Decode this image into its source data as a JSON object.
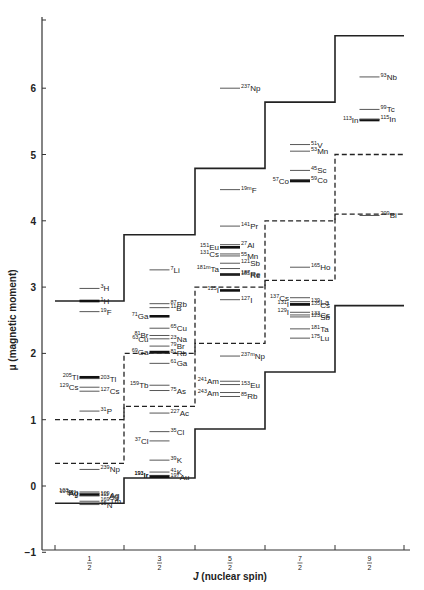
{
  "chart_data": {
    "type": "scatter",
    "title": "",
    "xlabel": "J (nuclear spin)",
    "ylabel": "μ (magnetic moment)",
    "ylim": [
      -1,
      7
    ],
    "yticks": [
      -1,
      0,
      1,
      2,
      3,
      4,
      5,
      6
    ],
    "categories": [
      "1/2",
      "3/2",
      "5/2",
      "7/2",
      "9/2"
    ],
    "grid": false,
    "legend": null,
    "schmidt_lines": [
      {
        "name": "upper (solid)",
        "style": "solid",
        "values": [
          2.79,
          3.79,
          4.79,
          5.79,
          6.79
        ]
      },
      {
        "name": "lower (solid)",
        "style": "solid",
        "values": [
          -0.26,
          0.12,
          0.86,
          1.72,
          2.72
        ]
      },
      {
        "name": "upper (dashed)",
        "style": "dashed",
        "values": [
          1.0,
          2.0,
          3.0,
          4.0,
          5.0
        ]
      },
      {
        "name": "lower (dashed)",
        "style": "dashed",
        "values": [
          0.34,
          1.2,
          2.15,
          3.1,
          4.1
        ]
      }
    ],
    "isotopes": [
      {
        "J": "1/2",
        "label": "3H",
        "mass": "3",
        "el": "H",
        "mu": 2.98,
        "side": "right"
      },
      {
        "J": "1/2",
        "label": "1H",
        "mass": "1",
        "el": "H",
        "mu": 2.79,
        "side": "right",
        "thick": true
      },
      {
        "J": "1/2",
        "label": "19F",
        "mass": "19",
        "el": "F",
        "mu": 2.63,
        "side": "right"
      },
      {
        "J": "1/2",
        "label": "205Tl",
        "mass": "205",
        "el": "Tl",
        "mu": 1.64,
        "side": "left",
        "thick": true
      },
      {
        "J": "1/2",
        "label": "203Tl",
        "mass": "203",
        "el": "Tl",
        "mu": 1.62,
        "side": "right"
      },
      {
        "J": "1/2",
        "label": "129Cs",
        "mass": "129",
        "el": "Cs",
        "mu": 1.49,
        "side": "left"
      },
      {
        "J": "1/2",
        "label": "127Cs",
        "mass": "127",
        "el": "Cs",
        "mu": 1.43,
        "side": "right"
      },
      {
        "J": "1/2",
        "label": "31P",
        "mass": "31",
        "el": "P",
        "mu": 1.13,
        "side": "right"
      },
      {
        "J": "1/2",
        "label": "239Np",
        "mass": "239",
        "el": "Np",
        "mu": 0.25,
        "side": "right"
      },
      {
        "J": "1/2",
        "label": "103Rh",
        "mass": "103",
        "el": "Rh",
        "mu": -0.09,
        "side": "left"
      },
      {
        "J": "1/2",
        "label": "109Ag",
        "mass": "109",
        "el": "Ag",
        "mu": -0.13,
        "side": "right",
        "thick": true
      },
      {
        "J": "1/2",
        "label": "107Ag",
        "mass": "107",
        "el": "Ag",
        "mu": -0.11,
        "side": "left"
      },
      {
        "J": "1/2",
        "label": "111Ag",
        "mass": "111",
        "el": "Ag",
        "mu": -0.15,
        "side": "right"
      },
      {
        "J": "1/2",
        "label": "169Tm",
        "mass": "169",
        "el": "Tm",
        "mu": -0.23,
        "side": "right"
      },
      {
        "J": "1/2",
        "label": "89Y",
        "mass": "89",
        "el": "Y",
        "mu": -0.14,
        "side": "left"
      },
      {
        "J": "1/2",
        "label": "15N",
        "mass": "15",
        "el": "N",
        "mu": -0.28,
        "side": "right"
      },
      {
        "J": "3/2",
        "label": "7Li",
        "mass": "7",
        "el": "Li",
        "mu": 3.26,
        "side": "right"
      },
      {
        "J": "3/2",
        "label": "87Rb",
        "mass": "87",
        "el": "Rb",
        "mu": 2.75,
        "side": "right"
      },
      {
        "J": "3/2",
        "label": "71Ga",
        "mass": "71",
        "el": "Ga",
        "mu": 2.56,
        "side": "left",
        "thick": true
      },
      {
        "J": "3/2",
        "label": "11B",
        "mass": "11",
        "el": "B",
        "mu": 2.69,
        "side": "right"
      },
      {
        "J": "3/2",
        "label": "81Br",
        "mass": "81",
        "el": "Br",
        "mu": 2.27,
        "side": "left"
      },
      {
        "J": "3/2",
        "label": "65Cu",
        "mass": "65",
        "el": "Cu",
        "mu": 2.38,
        "side": "right"
      },
      {
        "J": "3/2",
        "label": "63Cu",
        "mass": "63",
        "el": "Cu",
        "mu": 2.22,
        "side": "left"
      },
      {
        "J": "3/2",
        "label": "23Na",
        "mass": "23",
        "el": "Na",
        "mu": 2.22,
        "side": "right"
      },
      {
        "J": "3/2",
        "label": "79Br",
        "mass": "79",
        "el": "Br",
        "mu": 2.11,
        "side": "right"
      },
      {
        "J": "3/2",
        "label": "69Ga",
        "mass": "69",
        "el": "Ga",
        "mu": 2.02,
        "side": "left",
        "thick": true
      },
      {
        "J": "3/2",
        "label": "81Rb",
        "mass": "81",
        "el": "Rb",
        "mu": 2.0,
        "side": "right"
      },
      {
        "J": "3/2",
        "label": "61Ga",
        "mass": "61",
        "el": "Ga",
        "mu": 1.85,
        "side": "right"
      },
      {
        "J": "3/2",
        "label": "159Tb",
        "mass": "159",
        "el": "Tb",
        "mu": 1.52,
        "side": "left"
      },
      {
        "J": "3/2",
        "label": "75As",
        "mass": "75",
        "el": "As",
        "mu": 1.44,
        "side": "right"
      },
      {
        "J": "3/2",
        "label": "227Ac",
        "mass": "227",
        "el": "Ac",
        "mu": 1.1,
        "side": "right"
      },
      {
        "J": "3/2",
        "label": "35Cl",
        "mass": "35",
        "el": "Cl",
        "mu": 0.82,
        "side": "right"
      },
      {
        "J": "3/2",
        "label": "37Cl",
        "mass": "37",
        "el": "Cl",
        "mu": 0.68,
        "side": "left"
      },
      {
        "J": "3/2",
        "label": "39K",
        "mass": "39",
        "el": "K",
        "mu": 0.39,
        "side": "right"
      },
      {
        "J": "3/2",
        "label": "191Ir",
        "mass": "191",
        "el": "Ir",
        "mu": 0.16,
        "side": "left"
      },
      {
        "J": "3/2",
        "label": "193Ir",
        "mass": "193",
        "el": "Ir",
        "mu": 0.17,
        "side": "left"
      },
      {
        "J": "3/2",
        "label": "41K",
        "mass": "41",
        "el": "K",
        "mu": 0.21,
        "side": "right"
      },
      {
        "J": "3/2",
        "label": "197Au",
        "mass": "197",
        "el": "Au",
        "mu": 0.14,
        "side": "right",
        "thick": true
      },
      {
        "J": "5/2",
        "label": "237Np",
        "mass": "237",
        "el": "Np",
        "mu": 6.0,
        "side": "right"
      },
      {
        "J": "5/2",
        "label": "19mF",
        "mass": "19m",
        "el": "F",
        "mu": 4.47,
        "side": "right"
      },
      {
        "J": "5/2",
        "label": "141Pr",
        "mass": "141",
        "el": "Pr",
        "mu": 3.92,
        "side": "right"
      },
      {
        "J": "5/2",
        "label": "151Eu",
        "mass": "151",
        "el": "Eu",
        "mu": 3.6,
        "side": "left",
        "thick": true
      },
      {
        "J": "5/2",
        "label": "27Al",
        "mass": "27",
        "el": "Al",
        "mu": 3.64,
        "side": "right"
      },
      {
        "J": "5/2",
        "label": "131Cs",
        "mass": "131",
        "el": "Cs",
        "mu": 3.5,
        "side": "left"
      },
      {
        "J": "5/2",
        "label": "55Mn",
        "mass": "55",
        "el": "Mn",
        "mu": 3.47,
        "side": "right"
      },
      {
        "J": "5/2",
        "label": "121Sb",
        "mass": "121",
        "el": "Sb",
        "mu": 3.36,
        "side": "right"
      },
      {
        "J": "5/2",
        "label": "181mTa",
        "mass": "181m",
        "el": "Ta",
        "mu": 3.28,
        "side": "left"
      },
      {
        "J": "5/2",
        "label": "185Re",
        "mass": "185",
        "el": "Re",
        "mu": 3.19,
        "side": "right",
        "thick": true
      },
      {
        "J": "5/2",
        "label": "187Re",
        "mass": "187",
        "el": "Re",
        "mu": 3.2,
        "side": "right"
      },
      {
        "J": "5/2",
        "label": "125I",
        "mass": "125",
        "el": "I",
        "mu": 2.95,
        "side": "left",
        "thick": true
      },
      {
        "J": "5/2",
        "label": "127I",
        "mass": "127",
        "el": "I",
        "mu": 2.81,
        "side": "right"
      },
      {
        "J": "5/2",
        "label": "237mNp",
        "mass": "237m",
        "el": "Np",
        "mu": 1.96,
        "side": "right"
      },
      {
        "J": "5/2",
        "label": "241Am",
        "mass": "241",
        "el": "Am",
        "mu": 1.58,
        "side": "left"
      },
      {
        "J": "5/2",
        "label": "153Eu",
        "mass": "153",
        "el": "Eu",
        "mu": 1.53,
        "side": "right"
      },
      {
        "J": "5/2",
        "label": "243Am",
        "mass": "243",
        "el": "Am",
        "mu": 1.41,
        "side": "left"
      },
      {
        "J": "5/2",
        "label": "85Rb",
        "mass": "85",
        "el": "Rb",
        "mu": 1.35,
        "side": "right"
      },
      {
        "J": "7/2",
        "label": "51V",
        "mass": "51",
        "el": "V",
        "mu": 5.15,
        "side": "right"
      },
      {
        "J": "7/2",
        "label": "53Mn",
        "mass": "53",
        "el": "Mn",
        "mu": 5.05,
        "side": "right"
      },
      {
        "J": "7/2",
        "label": "45Sc",
        "mass": "45",
        "el": "Sc",
        "mu": 4.76,
        "side": "right"
      },
      {
        "J": "7/2",
        "label": "57Co",
        "mass": "57",
        "el": "Co",
        "mu": 4.6,
        "side": "left",
        "thick": true
      },
      {
        "J": "7/2",
        "label": "59Co",
        "mass": "59",
        "el": "Co",
        "mu": 4.62,
        "side": "right"
      },
      {
        "J": "7/2",
        "label": "165Ho",
        "mass": "165",
        "el": "Ho",
        "mu": 3.3,
        "side": "right"
      },
      {
        "J": "7/2",
        "label": "137Cs",
        "mass": "137",
        "el": "Cs",
        "mu": 2.84,
        "side": "left"
      },
      {
        "J": "7/2",
        "label": "139La",
        "mass": "139",
        "el": "La",
        "mu": 2.78,
        "side": "right"
      },
      {
        "J": "7/2",
        "label": "129I",
        "mass": "129",
        "el": "I",
        "mu": 2.62,
        "side": "left"
      },
      {
        "J": "7/2",
        "label": "135Cs",
        "mass": "135",
        "el": "Cs",
        "mu": 2.73,
        "side": "right"
      },
      {
        "J": "7/2",
        "label": "131I",
        "mass": "131",
        "el": "I",
        "mu": 2.74,
        "side": "left",
        "thick": true
      },
      {
        "J": "7/2",
        "label": "133Cs",
        "mass": "133",
        "el": "Cs",
        "mu": 2.58,
        "side": "right"
      },
      {
        "J": "7/2",
        "label": "123Sb",
        "mass": "123",
        "el": "Sb",
        "mu": 2.55,
        "side": "right"
      },
      {
        "J": "7/2",
        "label": "181Ta",
        "mass": "181",
        "el": "Ta",
        "mu": 2.37,
        "side": "right"
      },
      {
        "J": "7/2",
        "label": "175Lu",
        "mass": "175",
        "el": "Lu",
        "mu": 2.23,
        "side": "right"
      },
      {
        "J": "9/2",
        "label": "93Nb",
        "mass": "93",
        "el": "Nb",
        "mu": 6.17,
        "side": "right"
      },
      {
        "J": "9/2",
        "label": "99Tc",
        "mass": "99",
        "el": "Tc",
        "mu": 5.68,
        "side": "right"
      },
      {
        "J": "9/2",
        "label": "113In",
        "mass": "113",
        "el": "In",
        "mu": 5.52,
        "side": "left",
        "thick": true
      },
      {
        "J": "9/2",
        "label": "115In",
        "mass": "115",
        "el": "In",
        "mu": 5.53,
        "side": "right"
      },
      {
        "J": "9/2",
        "label": "209Bi",
        "mass": "209",
        "el": "Bi",
        "mu": 4.08,
        "side": "right"
      }
    ]
  },
  "axes": {
    "y_title": "μ (magnetic moment)",
    "x_title_italic": "J",
    "x_title_rest": " (nuclear spin)",
    "x_fractions": [
      {
        "num": "1",
        "den": "2"
      },
      {
        "num": "3",
        "den": "2"
      },
      {
        "num": "5",
        "den": "2"
      },
      {
        "num": "7",
        "den": "2"
      },
      {
        "num": "9",
        "den": "2"
      }
    ],
    "y_tick_labels": [
      "−1",
      "0",
      "1",
      "2",
      "3",
      "4",
      "5",
      "6"
    ]
  }
}
